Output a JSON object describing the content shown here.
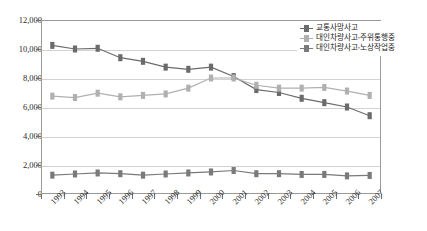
{
  "chart_data": {
    "type": "line",
    "title": "",
    "xlabel": "",
    "ylabel": "",
    "ylim": [
      0,
      12000
    ],
    "ytick_values": [
      0,
      2000,
      4000,
      6000,
      8000,
      10000,
      12000
    ],
    "ytick_labels": [
      "0",
      "2,000",
      "4,000",
      "6,000",
      "8,000",
      "10,000",
      "12,000"
    ],
    "grid": true,
    "legend_position": "top-right",
    "categories": [
      "1993",
      "1994",
      "1995",
      "1996",
      "1997",
      "1998",
      "1999",
      "2000",
      "2001",
      "2002",
      "2003",
      "2004",
      "2005",
      "2006",
      "2007"
    ],
    "series": [
      {
        "name": "교통사망사고",
        "color": "#6b6b6b",
        "values": [
          10250,
          10000,
          10050,
          9400,
          9150,
          8750,
          8600,
          8750,
          8100,
          7200,
          7000,
          6600,
          6300,
          6000,
          5400
        ]
      },
      {
        "name": "대인차량사고-주위통행중",
        "color": "#b0b0b0",
        "values": [
          6750,
          6650,
          6950,
          6700,
          6800,
          6900,
          7300,
          8000,
          8000,
          7500,
          7300,
          7300,
          7350,
          7100,
          6800
        ]
      },
      {
        "name": "대인차량사고-노상작업중",
        "color": "#7a7a7a",
        "values": [
          1300,
          1380,
          1450,
          1400,
          1300,
          1380,
          1450,
          1520,
          1620,
          1400,
          1400,
          1350,
          1350,
          1250,
          1280
        ]
      }
    ]
  },
  "legend": {
    "items": [
      {
        "label": "교통사망사고"
      },
      {
        "label": "대인차량사고-주위통행중"
      },
      {
        "label": "대인차량사고-노상작업중"
      }
    ]
  },
  "axes": {
    "y_labels": [
      "12,000",
      "10,000",
      "8,000",
      "6,000",
      "4,000",
      "2,000",
      "0"
    ],
    "x_labels": [
      "1993",
      "1994",
      "1995",
      "1996",
      "1997",
      "1998",
      "1999",
      "2000",
      "2001",
      "2002",
      "2003",
      "2004",
      "2005",
      "2006",
      "2007"
    ]
  }
}
